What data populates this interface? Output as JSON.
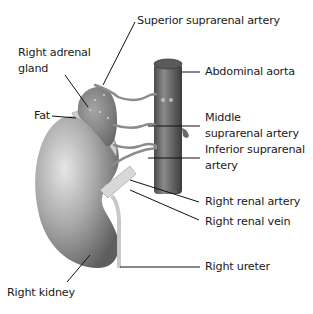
{
  "diagram": {
    "type": "anatomical-illustration",
    "labels": {
      "superior_suprarenal_artery": "Superior suprarenal artery",
      "right_adrenal_gland_1": "Right adrenal",
      "right_adrenal_gland_2": "gland",
      "abdominal_aorta": "Abdominal aorta",
      "fat": "Fat",
      "middle_suprarenal_artery_1": "Middle",
      "middle_suprarenal_artery_2": "suprarenal artery",
      "inferior_suprarenal_artery_1": "Inferior suprarenal",
      "inferior_suprarenal_artery_2": "artery",
      "right_renal_artery": "Right renal artery",
      "right_renal_vein": "Right renal vein",
      "right_ureter": "Right ureter",
      "right_kidney": "Right kidney"
    },
    "colors": {
      "background": "#ffffff",
      "label_text": "#1a1a1a",
      "leader_line": "#111111",
      "kidney_light": "#d4d4d4",
      "kidney_dark": "#6e6e6e",
      "aorta": "#5a5a5a",
      "adrenal": "#8a8a8a",
      "fat": "#c8c8c8",
      "vessel": "#8c8c8c"
    }
  }
}
